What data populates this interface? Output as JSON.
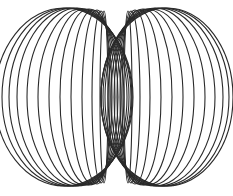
{
  "figure": {
    "stroke_color": "#2a2a2a",
    "background": "#ffffff",
    "center_x": 116,
    "left_coils": [
      {
        "cx": 104,
        "cy": 97,
        "rx": 4,
        "ry": 86
      },
      {
        "cx": 101,
        "cy": 97,
        "rx": 9,
        "ry": 86
      },
      {
        "cx": 97,
        "cy": 97,
        "rx": 15,
        "ry": 87
      },
      {
        "cx": 93,
        "cy": 97,
        "rx": 22,
        "ry": 87
      },
      {
        "cx": 89,
        "cy": 97,
        "rx": 29,
        "ry": 88
      },
      {
        "cx": 85,
        "cy": 97,
        "rx": 36,
        "ry": 88
      },
      {
        "cx": 81,
        "cy": 97,
        "rx": 43,
        "ry": 88
      },
      {
        "cx": 77,
        "cy": 97,
        "rx": 50,
        "ry": 89
      },
      {
        "cx": 73,
        "cy": 97,
        "rx": 56,
        "ry": 89
      },
      {
        "cx": 70,
        "cy": 97,
        "rx": 61,
        "ry": 89
      },
      {
        "cx": 67,
        "cy": 97,
        "rx": 65,
        "ry": 89
      },
      {
        "cx": 64,
        "cy": 97,
        "rx": 69,
        "ry": 89
      }
    ],
    "right_coils": [
      {
        "cx": 128,
        "cy": 97,
        "rx": 4,
        "ry": 86
      },
      {
        "cx": 131,
        "cy": 97,
        "rx": 9,
        "ry": 86
      },
      {
        "cx": 135,
        "cy": 97,
        "rx": 15,
        "ry": 87
      },
      {
        "cx": 139,
        "cy": 97,
        "rx": 22,
        "ry": 87
      },
      {
        "cx": 143,
        "cy": 97,
        "rx": 29,
        "ry": 88
      },
      {
        "cx": 147,
        "cy": 97,
        "rx": 36,
        "ry": 88
      },
      {
        "cx": 151,
        "cy": 97,
        "rx": 43,
        "ry": 88
      },
      {
        "cx": 155,
        "cy": 97,
        "rx": 50,
        "ry": 89
      },
      {
        "cx": 159,
        "cy": 97,
        "rx": 56,
        "ry": 89
      },
      {
        "cx": 162,
        "cy": 97,
        "rx": 61,
        "ry": 89
      },
      {
        "cx": 165,
        "cy": 97,
        "rx": 64,
        "ry": 89
      },
      {
        "cx": 167,
        "cy": 97,
        "rx": 66,
        "ry": 89
      }
    ]
  }
}
